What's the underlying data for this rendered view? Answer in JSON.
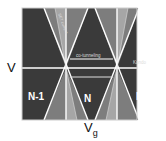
{
  "diagram": {
    "y_axis_label": "V",
    "x_axis_label": "V",
    "x_axis_subscript": "g",
    "regions": [
      "N-1",
      "N",
      "N+1"
    ],
    "annotations": {
      "cone_text": "SET current",
      "center_text": "co-tunneling",
      "right_text": "Kondo"
    },
    "colors": {
      "dark": "#3a3a3a",
      "mid": "#7d7d7d",
      "light": "#a6a6a6",
      "line": "#ffffff"
    }
  }
}
